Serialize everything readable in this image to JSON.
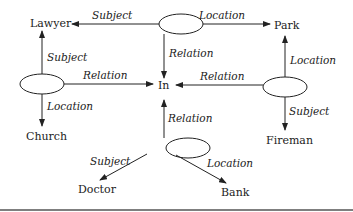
{
  "diagram": {
    "type": "semantic network",
    "concept_nodes": {
      "lawyer": "Lawyer",
      "park": "Park",
      "in": "In",
      "church": "Church",
      "fireman": "Fireman",
      "doctor": "Doctor",
      "bank": "Bank"
    },
    "proposition_nodes": [
      "P1 (top)",
      "P2 (left)",
      "P3 (right)",
      "P4 (bottom)"
    ],
    "edge_labels": {
      "subject": "Subject",
      "location": "Location",
      "relation": "Relation"
    },
    "edges": [
      {
        "from": "P1 (top)",
        "label": "Subject",
        "to": "Lawyer"
      },
      {
        "from": "P1 (top)",
        "label": "Location",
        "to": "Park"
      },
      {
        "from": "P1 (top)",
        "label": "Relation",
        "to": "In"
      },
      {
        "from": "P2 (left)",
        "label": "Subject",
        "to": "Lawyer"
      },
      {
        "from": "P2 (left)",
        "label": "Relation",
        "to": "In"
      },
      {
        "from": "P2 (left)",
        "label": "Location",
        "to": "Church"
      },
      {
        "from": "P3 (right)",
        "label": "Location",
        "to": "Park"
      },
      {
        "from": "P3 (right)",
        "label": "Relation",
        "to": "In"
      },
      {
        "from": "P3 (right)",
        "label": "Subject",
        "to": "Fireman"
      },
      {
        "from": "P4 (bottom)",
        "label": "Relation",
        "to": "In"
      },
      {
        "from": "P4 (bottom)",
        "label": "Subject",
        "to": "Doctor"
      },
      {
        "from": "P4 (bottom)",
        "label": "Location",
        "to": "Bank"
      }
    ]
  }
}
